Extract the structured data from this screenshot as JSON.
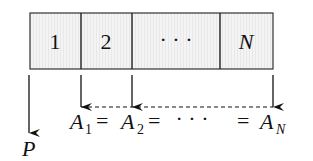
{
  "diagram": {
    "cells": [
      {
        "label": "1",
        "italic": false
      },
      {
        "label": "2",
        "italic": false
      },
      {
        "label": "· · ·",
        "italic": false
      },
      {
        "label": "N",
        "italic": true
      }
    ],
    "source_label": "P",
    "equation": {
      "a1": "A",
      "a1_sub": "1",
      "eq1": "=",
      "a2": "A",
      "a2_sub": "2",
      "eq2": "=",
      "ellipsis": "· · ·",
      "eq3": "=",
      "an": "A",
      "an_sub": "N"
    },
    "colors": {
      "ink": "#111111",
      "cell_background": "#f2f2f2"
    }
  }
}
